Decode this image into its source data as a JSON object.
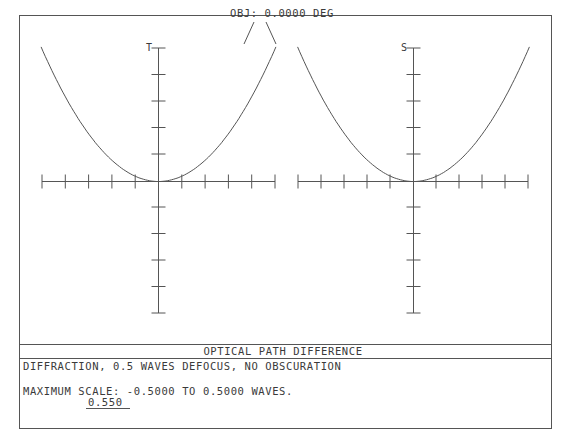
{
  "header": {
    "field_label": "OBJ: 0.0000 DEG"
  },
  "plots": {
    "left_axis_label": "T",
    "right_axis_label": "S"
  },
  "footer": {
    "title": "OPTICAL PATH DIFFERENCE",
    "description": "DIFFRACTION, 0.5 WAVES DEFOCUS, NO OBSCURATION",
    "scale_line": "MAXIMUM SCALE: -0.5000 TO 0.5000 WAVES.",
    "wavelength": "0.550"
  },
  "colors": {
    "line": "#555555",
    "text": "#3a3a3a",
    "background": "#ffffff"
  },
  "chart_data": [
    {
      "type": "line",
      "title": "Tangential OPD",
      "axis_label": "T",
      "x": [
        -1.0,
        -0.8,
        -0.6,
        -0.4,
        -0.2,
        0.0,
        0.2,
        0.4,
        0.6,
        0.8,
        1.0
      ],
      "series": [
        {
          "name": "OPD (waves)",
          "values": [
            0.5,
            0.32,
            0.18,
            0.08,
            0.02,
            0.0,
            0.02,
            0.08,
            0.18,
            0.32,
            0.5
          ]
        }
      ],
      "xlabel": "Normalized pupil coordinate (tangential)",
      "ylabel": "Waves",
      "ylim": [
        -0.5,
        0.5
      ],
      "x_ticks": 11,
      "y_ticks": 11,
      "grid": false,
      "note": "Parabolic defocus curve; clipped at top of plot frame"
    },
    {
      "type": "line",
      "title": "Sagittal OPD",
      "axis_label": "S",
      "x": [
        -1.0,
        -0.8,
        -0.6,
        -0.4,
        -0.2,
        0.0,
        0.2,
        0.4,
        0.6,
        0.8,
        1.0
      ],
      "series": [
        {
          "name": "OPD (waves)",
          "values": [
            0.5,
            0.32,
            0.18,
            0.08,
            0.02,
            0.0,
            0.02,
            0.08,
            0.18,
            0.32,
            0.5
          ]
        }
      ],
      "xlabel": "Normalized pupil coordinate (sagittal)",
      "ylabel": "Waves",
      "ylim": [
        -0.5,
        0.5
      ],
      "x_ticks": 11,
      "y_ticks": 11,
      "grid": false
    }
  ]
}
